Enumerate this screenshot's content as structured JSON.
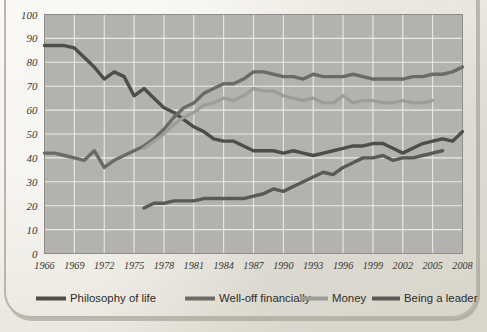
{
  "chart_data": {
    "type": "line",
    "title": "",
    "subtitle": "",
    "xlabel": "",
    "ylabel": "",
    "xlim": [
      1966,
      2008
    ],
    "ylim": [
      0,
      100
    ],
    "grid": true,
    "legend_position": "bottom",
    "ytick_labels": [
      "100",
      "90",
      "80",
      "70",
      "60",
      "50",
      "40",
      "30",
      "20",
      "10",
      "0"
    ],
    "ytick_values": [
      100,
      90,
      80,
      70,
      60,
      50,
      40,
      30,
      20,
      10,
      0
    ],
    "xtick_labels": [
      "1966",
      "1969",
      "1972",
      "1975",
      "1978",
      "1981",
      "1984",
      "1987",
      "1990",
      "1993",
      "1996",
      "1999",
      "2002",
      "2005",
      "2008"
    ],
    "xtick_values": [
      1966,
      1969,
      1972,
      1975,
      1978,
      1981,
      1984,
      1987,
      1990,
      1993,
      1996,
      1999,
      2002,
      2005,
      2008
    ],
    "series": [
      {
        "name": "Philosophy of life",
        "color": "#4f4d49",
        "width": 3.4,
        "x": [
          1966,
          1967,
          1968,
          1969,
          1970,
          1971,
          1972,
          1973,
          1974,
          1975,
          1976,
          1977,
          1978,
          1979,
          1980,
          1981,
          1982,
          1983,
          1984,
          1985,
          1986,
          1987,
          1988,
          1989,
          1990,
          1991,
          1992,
          1993,
          1994,
          1995,
          1996,
          1997,
          1998,
          1999,
          2000,
          2001,
          2002,
          2003,
          2004,
          2005,
          2006,
          2007,
          2008
        ],
        "values": [
          87,
          87,
          87,
          86,
          82,
          78,
          73,
          76,
          74,
          66,
          69,
          65,
          61,
          59,
          56,
          53,
          51,
          48,
          47,
          47,
          45,
          43,
          43,
          43,
          42,
          43,
          42,
          41,
          42,
          43,
          44,
          45,
          45,
          46,
          46,
          44,
          42,
          44,
          46,
          47,
          48,
          47,
          51
        ]
      },
      {
        "name": "Well-off financially",
        "color": "#6b6a66",
        "width": 3.4,
        "x": [
          1966,
          1967,
          1968,
          1969,
          1970,
          1971,
          1972,
          1973,
          1974,
          1975,
          1976,
          1977,
          1978,
          1979,
          1980,
          1981,
          1982,
          1983,
          1984,
          1985,
          1986,
          1987,
          1988,
          1989,
          1990,
          1991,
          1992,
          1993,
          1994,
          1995,
          1996,
          1997,
          1998,
          1999,
          2000,
          2001,
          2002,
          2003,
          2004,
          2005,
          2006,
          2007,
          2008
        ],
        "values": [
          42,
          42,
          41,
          40,
          39,
          43,
          36,
          39,
          41,
          43,
          45,
          48,
          52,
          57,
          61,
          63,
          67,
          69,
          71,
          71,
          73,
          76,
          76,
          75,
          74,
          74,
          73,
          75,
          74,
          74,
          74,
          75,
          74,
          73,
          73,
          73,
          73,
          74,
          74,
          75,
          75,
          76,
          78
        ]
      },
      {
        "name": "Money",
        "color": "#9d9c98",
        "width": 3.2,
        "x": [
          1976,
          1977,
          1978,
          1979,
          1980,
          1981,
          1982,
          1983,
          1984,
          1985,
          1986,
          1987,
          1988,
          1989,
          1990,
          1991,
          1992,
          1993,
          1994,
          1995,
          1996,
          1997,
          1998,
          1999,
          2000,
          2001,
          2002,
          2003,
          2004,
          2005
        ],
        "values": [
          44,
          47,
          50,
          54,
          57,
          59,
          62,
          63,
          65,
          64,
          66,
          69,
          68,
          68,
          66,
          65,
          64,
          65,
          63,
          63,
          66,
          63,
          64,
          64,
          63,
          63,
          64,
          63,
          63,
          64
        ]
      },
      {
        "name": "Being a leader",
        "color": "#5a5955",
        "width": 3.4,
        "x": [
          1976,
          1977,
          1978,
          1979,
          1980,
          1981,
          1982,
          1983,
          1984,
          1985,
          1986,
          1987,
          1988,
          1989,
          1990,
          1991,
          1992,
          1993,
          1994,
          1995,
          1996,
          1997,
          1998,
          1999,
          2000,
          2001,
          2002,
          2003,
          2004,
          2005,
          2006
        ],
        "values": [
          19,
          21,
          21,
          22,
          22,
          22,
          23,
          23,
          23,
          23,
          23,
          24,
          25,
          27,
          26,
          28,
          30,
          32,
          34,
          33,
          36,
          38,
          40,
          40,
          41,
          39,
          40,
          40,
          41,
          42,
          43
        ]
      }
    ]
  },
  "axis": {
    "y_label_style": "italic-serif",
    "x_label_style": "italic-serif"
  },
  "legend": {
    "items": [
      {
        "label": "Philosophy of life",
        "color": "#4f4d49"
      },
      {
        "label": "Well-off financially",
        "color": "#6b6a66"
      },
      {
        "label": "Money",
        "color": "#9d9c98"
      },
      {
        "label": "Being a leader",
        "color": "#5a5955"
      }
    ]
  },
  "colors": {
    "paper": "#efece4",
    "plot_background": "#b3b2ae",
    "gridline": "#eceae4",
    "frame": "#b9b5aa",
    "text": "#3a3833"
  }
}
